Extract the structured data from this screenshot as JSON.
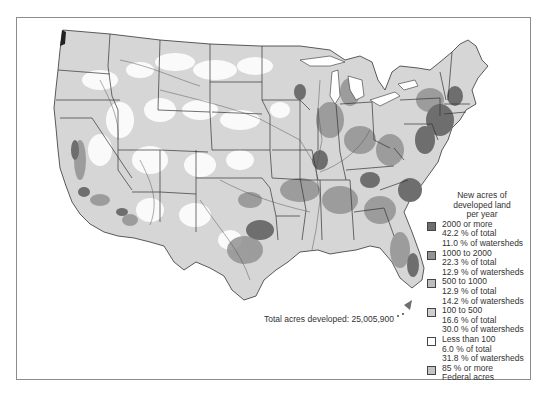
{
  "map": {
    "subject": "Contiguous United States - new acres of developed land per year by watershed",
    "total_label": "Total acres developed: 25,005,900"
  },
  "legend": {
    "title_lines": [
      "New acres of",
      "developed land",
      "per year"
    ],
    "items": [
      {
        "range": "2000 or more",
        "pct_total": "42.2 % of total",
        "pct_watersheds": "11.0 % of watersheds",
        "color": "#6e6e6e"
      },
      {
        "range": "1000 to 2000",
        "pct_total": "22.3 % of total",
        "pct_watersheds": "12.9 % of watersheds",
        "color": "#939393"
      },
      {
        "range": "500 to 1000",
        "pct_total": "12.9 % of total",
        "pct_watersheds": "14.2 % of watersheds",
        "color": "#bdbdbd"
      },
      {
        "range": "100 to 500",
        "pct_total": "16.6 % of total",
        "pct_watersheds": "30.0 % of watersheds",
        "color": "#cfcfcf"
      },
      {
        "range": "Less than 100",
        "pct_total": "6.0 % of total",
        "pct_watersheds": "31.8 % of watersheds",
        "color": "#ffffff"
      },
      {
        "range": "85 % or more",
        "pct_total": "Federal acres",
        "pct_watersheds": "",
        "color": "#c4c4c4"
      }
    ]
  },
  "colors": {
    "frame_border": "#8c8c8c",
    "state_border": "#333333",
    "river": "#555555",
    "text": "#333333"
  }
}
